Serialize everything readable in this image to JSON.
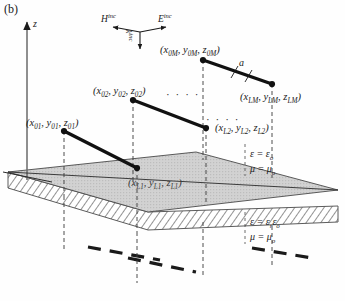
{
  "figure": {
    "panel_label": "(b)",
    "type": "3D schematic of a dipole array above a dielectric half-space / slab"
  },
  "axes": {
    "z_label": "z",
    "z_axis_name": "vertical z axis with upward arrow"
  },
  "incident": {
    "h_label": "H",
    "h_sup": "inc",
    "e_label": "E",
    "e_sup": "inc",
    "k_label": "k",
    "k_sup": "inc"
  },
  "dipoles": [
    {
      "id": "dipole-0M",
      "label_x": "x",
      "label_x_sub": "0M",
      "label_y": "y",
      "label_y_sub": "0M",
      "label_z": "z",
      "label_z_sub": "0M",
      "text": "(x0M, y0M, z0M)"
    },
    {
      "id": "dipole-LM",
      "label_x": "x",
      "label_x_sub": "LM",
      "label_y": "y",
      "label_y_sub": "LM",
      "label_z": "z",
      "label_z_sub": "LM",
      "text": "(xLM, yLM, zLM)"
    },
    {
      "id": "dipole-02",
      "label_x": "x",
      "label_x_sub": "02",
      "label_y": "y",
      "label_y_sub": "02",
      "label_z": "z",
      "label_z_sub": "02",
      "text": "(x02, y02, z02)"
    },
    {
      "id": "dipole-L2",
      "label_x": "x",
      "label_x_sub": "L2",
      "label_y": "y",
      "label_y_sub": "L2",
      "label_z": "z",
      "label_z_sub": "L2",
      "text": "(xL2, yL2, zL2)"
    },
    {
      "id": "dipole-01",
      "label_x": "x",
      "label_x_sub": "01",
      "label_y": "y",
      "label_y_sub": "01",
      "label_z": "z",
      "label_z_sub": "01",
      "text": "(x01, y01, z01)"
    },
    {
      "id": "dipole-L1",
      "label_x": "x",
      "label_x_sub": "L1",
      "label_y": "y",
      "label_y_sub": "L1",
      "label_z": "z",
      "label_z_sub": "L1",
      "text": "(xL1, yL1, zL1)"
    }
  ],
  "dimension": {
    "a_label": "a"
  },
  "ellipsis": {
    "glyph": "· · · ·"
  },
  "media": {
    "upper": {
      "eps_sym": "ε",
      "eps_eq": " = ",
      "eps_val": "ε",
      "eps_val_sub": "o",
      "mu_sym": "μ",
      "mu_val": "μ",
      "mu_val_sub": "o",
      "text": "ε = εo ,  μ = μo"
    },
    "lower": {
      "eps_sym": "ε",
      "eps_val_r": "ε",
      "eps_val_r_sub": "r",
      "eps_val_o": "ε",
      "eps_val_o_sub": "o",
      "mu_sym": "μ",
      "mu_val": "μ",
      "mu_val_sub": "o",
      "text": "ε = εr εo ,  μ = μo"
    }
  },
  "colors": {
    "line": "#1a1a1a",
    "slab_fill": "#cfcfcf",
    "hatch": "#7a7a7a",
    "dashed": "#3a3a3a",
    "axis": "#555555"
  }
}
